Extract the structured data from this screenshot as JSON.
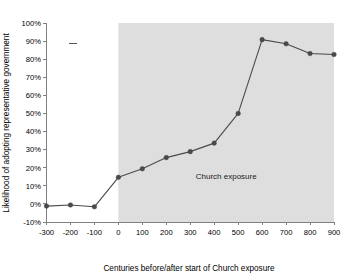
{
  "chart_data": {
    "type": "line",
    "title": "",
    "xlabel": "Centuries before/after start of Church exposure",
    "ylabel": "Likelihood of adopting representative government",
    "x": [
      -300,
      -200,
      -100,
      0,
      100,
      200,
      300,
      400,
      500,
      600,
      700,
      800,
      900
    ],
    "values": [
      -0.012,
      -0.006,
      -0.016,
      0.147,
      0.194,
      0.256,
      0.289,
      0.336,
      0.5,
      0.908,
      0.885,
      0.831,
      0.826
    ],
    "series": [
      {
        "name": "Likelihood of adopting representative government",
        "values": [
          -0.012,
          -0.006,
          -0.016,
          0.147,
          0.194,
          0.256,
          0.289,
          0.336,
          0.5,
          0.908,
          0.885,
          0.831,
          0.826
        ]
      }
    ],
    "xlim": [
      -300,
      900
    ],
    "ylim": [
      -0.1,
      1.0
    ],
    "xticks": [
      -300,
      -200,
      -100,
      0,
      100,
      200,
      300,
      400,
      500,
      600,
      700,
      800,
      900
    ],
    "xtick_labels": [
      "-300",
      "-200",
      "-100",
      "0",
      "100",
      "200",
      "300",
      "400",
      "500",
      "600",
      "700",
      "800",
      "900"
    ],
    "yticks": [
      -0.1,
      0.0,
      0.1,
      0.2,
      0.3,
      0.4,
      0.5,
      0.6,
      0.7,
      0.8,
      0.9,
      1.0
    ],
    "ytick_labels": [
      "-10%",
      "0%",
      "10%",
      "20%",
      "30%",
      "40%",
      "50%",
      "60%",
      "70%",
      "80%",
      "90%",
      "100%"
    ],
    "grid": false,
    "legend": "none",
    "line_color": "#4a4a4a",
    "marker_color": "#4a4a4a",
    "annotations": [
      {
        "name": "church-exposure-band",
        "label": "Church exposure",
        "x_start": 0,
        "x_end": 900,
        "shade_color": "#dedede",
        "label_x": 450,
        "label_y": 0.135
      }
    ]
  },
  "axes": {
    "y_title": "Likelihood of adopting representative government",
    "x_title": "Centuries before/after start of Church exposure"
  },
  "band": {
    "label": "Church exposure"
  }
}
